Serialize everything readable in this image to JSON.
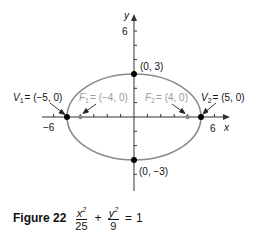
{
  "figure": {
    "label": "Figure 22",
    "equation": {
      "term1_num": "x",
      "term1_exp": "2",
      "term1_den": "25",
      "plus": "+",
      "term2_num": "y",
      "term2_exp": "2",
      "term2_den": "9",
      "equals": "=",
      "rhs": "1"
    }
  },
  "axes": {
    "x_label": "x",
    "y_label": "y",
    "x_tick_neg": "−6",
    "x_tick_pos": "6",
    "y_tick_top": "6"
  },
  "points": {
    "v1": {
      "name": "V",
      "sub": "1",
      "coords": "= (−5, 0)"
    },
    "v2": {
      "name": "V",
      "sub": "2",
      "coords": "= (5, 0)"
    },
    "f1": {
      "name": "F",
      "sub": "1",
      "coords": "= (−4, 0)"
    },
    "f2": {
      "name": "F",
      "sub": "2",
      "coords": "= (4, 0)"
    },
    "top": "(0, 3)",
    "bottom": "(0, −3)"
  },
  "colors": {
    "ellipse": "#8a8a8a",
    "axis": "#333333",
    "vertex": "#000000",
    "focus": "#8a8a8a",
    "focus_label": "#9a9a9a"
  }
}
